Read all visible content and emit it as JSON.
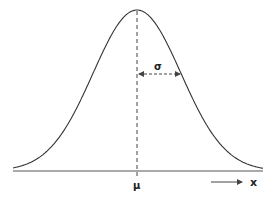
{
  "diagram": {
    "type": "normal-distribution",
    "labels": {
      "mean": "μ",
      "std_dev": "σ",
      "x_axis": "x"
    },
    "colors": {
      "curve": "#333333",
      "axis": "#555555",
      "dashed": "#444444",
      "text": "#222222"
    }
  },
  "chart_data": {
    "type": "line",
    "title": "",
    "xlabel": "x",
    "ylabel": "",
    "annotations": [
      "μ (mean, dashed vertical line at peak)",
      "σ (standard deviation, dashed double arrow from mean to inflection point)"
    ],
    "grid": false
  }
}
